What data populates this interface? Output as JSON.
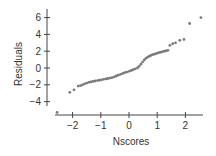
{
  "chart_data": {
    "type": "scatter",
    "title": "",
    "xlabel": "Nscores",
    "ylabel": "Residuals",
    "xlim": [
      -2.7,
      2.7
    ],
    "ylim": [
      -5.5,
      6.5
    ],
    "xticks": [
      -2,
      -1,
      0,
      1,
      2
    ],
    "xtick_labels": [
      "−2",
      "−1",
      "0",
      "1",
      "2"
    ],
    "yticks": [
      -4,
      -2,
      0,
      2,
      4,
      6
    ],
    "ytick_labels": [
      "−4",
      "−2",
      "0",
      "2",
      "4",
      "6"
    ],
    "grid": false,
    "legend": null,
    "point_color": "#7a7a7a",
    "axis_color": "#444444",
    "series": [
      {
        "name": "residuals",
        "points": [
          [
            -2.55,
            -5.3
          ],
          [
            -2.1,
            -2.9
          ],
          [
            -1.95,
            -2.6
          ],
          [
            -1.8,
            -2.15
          ],
          [
            -1.72,
            -2.1
          ],
          [
            -1.65,
            -2.0
          ],
          [
            -1.58,
            -1.9
          ],
          [
            -1.5,
            -1.8
          ],
          [
            -1.42,
            -1.7
          ],
          [
            -1.35,
            -1.65
          ],
          [
            -1.28,
            -1.6
          ],
          [
            -1.2,
            -1.55
          ],
          [
            -1.12,
            -1.5
          ],
          [
            -1.05,
            -1.45
          ],
          [
            -0.98,
            -1.42
          ],
          [
            -0.9,
            -1.35
          ],
          [
            -0.82,
            -1.3
          ],
          [
            -0.75,
            -1.25
          ],
          [
            -0.68,
            -1.2
          ],
          [
            -0.6,
            -1.15
          ],
          [
            -0.52,
            -1.05
          ],
          [
            -0.45,
            -0.95
          ],
          [
            -0.38,
            -0.85
          ],
          [
            -0.3,
            -0.75
          ],
          [
            -0.22,
            -0.65
          ],
          [
            -0.15,
            -0.55
          ],
          [
            -0.08,
            -0.48
          ],
          [
            0.0,
            -0.4
          ],
          [
            0.08,
            -0.3
          ],
          [
            0.15,
            -0.2
          ],
          [
            0.22,
            -0.1
          ],
          [
            0.3,
            0.0
          ],
          [
            0.36,
            0.2
          ],
          [
            0.42,
            0.45
          ],
          [
            0.48,
            0.7
          ],
          [
            0.54,
            0.95
          ],
          [
            0.6,
            1.15
          ],
          [
            0.66,
            1.3
          ],
          [
            0.72,
            1.4
          ],
          [
            0.78,
            1.5
          ],
          [
            0.84,
            1.6
          ],
          [
            0.9,
            1.65
          ],
          [
            0.96,
            1.72
          ],
          [
            1.02,
            1.78
          ],
          [
            1.08,
            1.85
          ],
          [
            1.14,
            1.9
          ],
          [
            1.2,
            1.95
          ],
          [
            1.26,
            2.0
          ],
          [
            1.32,
            2.05
          ],
          [
            1.38,
            2.1
          ],
          [
            1.45,
            2.7
          ],
          [
            1.55,
            2.9
          ],
          [
            1.65,
            3.0
          ],
          [
            1.8,
            3.3
          ],
          [
            1.95,
            3.4
          ],
          [
            2.15,
            5.3
          ],
          [
            2.55,
            6.0
          ]
        ]
      }
    ]
  }
}
